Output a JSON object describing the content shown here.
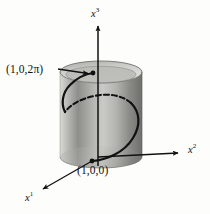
{
  "figure": {
    "caption_type": "3d-helix-on-cylinder",
    "background_color": "#fdfdfb",
    "ink_color": "#111111",
    "labels": {
      "top_point": "(1,0,2π)",
      "bottom_point": "(1,0,0)"
    },
    "axes": [
      {
        "id": "x3",
        "base": "x",
        "superscript": "3",
        "direction": "up",
        "origin": [
          98,
          160
        ],
        "tip": [
          98,
          24
        ]
      },
      {
        "id": "x2",
        "base": "x",
        "superscript": "2",
        "direction": "right",
        "origin": [
          98,
          157
        ],
        "tip": [
          181,
          153
        ]
      },
      {
        "id": "x1",
        "base": "x",
        "superscript": "1",
        "direction": "lower-left",
        "origin": [
          92,
          161
        ],
        "tip": [
          40,
          191
        ]
      }
    ],
    "cylinder": {
      "center_x": 101,
      "top_center_y": 72,
      "bottom_center_y": 157,
      "radius_x": 41,
      "radius_y": 11,
      "shading": "vertical-gradient-grayscale",
      "gradient_stops": [
        "#d8d8d4",
        "#9a9a96",
        "#c9c9c5",
        "#8e8e8a",
        "#b3b3af",
        "#6f6f6c"
      ]
    },
    "curve": {
      "name": "helix",
      "turns": 1,
      "start_point": [
        92,
        161
      ],
      "end_point": [
        93,
        73
      ],
      "solid_color": "#111111",
      "dash_pattern": "5 3",
      "stroke_width": 2.1
    },
    "leader": {
      "from": [
        60,
        70
      ],
      "to": [
        92,
        74
      ]
    }
  }
}
